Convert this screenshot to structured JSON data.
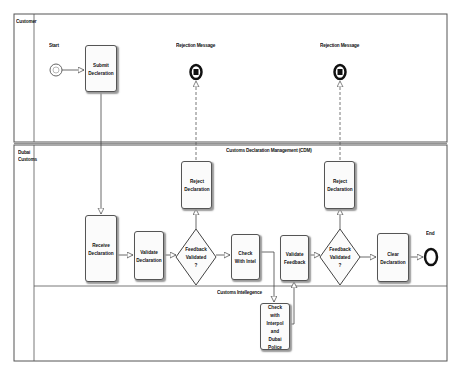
{
  "pools": {
    "customer": {
      "label": "Customer"
    },
    "dubai_customs": {
      "label": "Dubai Customs",
      "label_lines": [
        "Dubai",
        "Customs"
      ],
      "sublanes": {
        "cdm": {
          "label": "Customs Declaration Management (CDM)"
        },
        "intelligence": {
          "label": "Customs Intellegence"
        }
      }
    }
  },
  "events": {
    "start": {
      "label": "Start"
    },
    "end": {
      "label": "End"
    },
    "rejection_1": {
      "label": "Rejection Message"
    },
    "rejection_2": {
      "label": "Rejection Message"
    }
  },
  "tasks": {
    "submit": {
      "lines": [
        "Submit",
        "Decleration"
      ]
    },
    "receive": {
      "lines": [
        "Receive",
        "Declaration"
      ]
    },
    "validate_decl": {
      "lines": [
        "Validate",
        "Declaration"
      ]
    },
    "reject_1": {
      "lines": [
        "Reject",
        "Declaration"
      ]
    },
    "check_intel": {
      "lines": [
        "Check",
        "With Intel"
      ]
    },
    "validate_feedback": {
      "lines": [
        "Validate",
        "Feedback"
      ]
    },
    "reject_2": {
      "lines": [
        "Reject",
        "Declaration"
      ]
    },
    "clear": {
      "lines": [
        "Clear",
        "Declaration"
      ]
    },
    "check_interpol": {
      "lines": [
        "Check with",
        "Interpol and",
        "Dubai Police"
      ]
    }
  },
  "gateways": {
    "gw1": {
      "lines": [
        "Feedback",
        "Validated",
        "?"
      ]
    },
    "gw2": {
      "lines": [
        "Feedback",
        "Validated",
        "?"
      ]
    }
  },
  "colors": {
    "line": "#333333",
    "frame": "#555555",
    "task_fill": "#fbfbfb"
  }
}
